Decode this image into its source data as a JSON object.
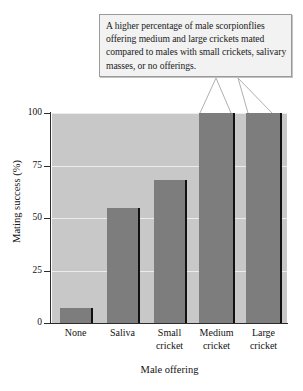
{
  "callout": {
    "text": "A higher percentage of male scorpionflies offering medium and large crickets mated compared to males with small crickets, salivary masses, or no offerings.",
    "points_to": [
      "Medium cricket",
      "Large cricket"
    ]
  },
  "colors": {
    "plot_background": "#c8c8c8",
    "bar_fill": "#7d7d7d",
    "bar_shadow": "#111111",
    "gridline": "#ececeb",
    "axis": "#2b2b2b",
    "callout_background": "#f2f2f2",
    "callout_border": "#9a9a9a",
    "text": "#121212"
  },
  "chart_data": {
    "type": "bar",
    "title": "",
    "xlabel": "Male offering",
    "ylabel": "Mating success (%)",
    "categories": [
      "None",
      "Saliva",
      "Small cricket",
      "Medium cricket",
      "Large cricket"
    ],
    "category_lines": [
      [
        "None"
      ],
      [
        "Saliva"
      ],
      [
        "Small",
        "cricket"
      ],
      [
        "Medium",
        "cricket"
      ],
      [
        "Large",
        "cricket"
      ]
    ],
    "values": [
      7,
      55,
      68,
      100,
      100
    ],
    "ylim": [
      0,
      100
    ],
    "yticks": [
      0,
      25,
      50,
      75,
      100
    ],
    "ytick_labels": [
      "0",
      "25",
      "50",
      "75",
      "100"
    ],
    "grid": true,
    "legend": false
  }
}
